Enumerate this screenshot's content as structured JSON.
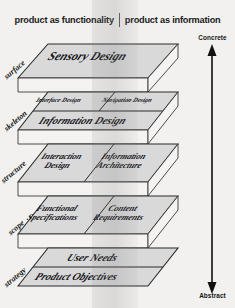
{
  "diagram": {
    "header": {
      "left_label": "product as functionality",
      "right_label": "product as information",
      "divider": "vertical-rule"
    },
    "axis": {
      "top_label": "Concrete",
      "bottom_label": "Abstract",
      "orientation": "vertical",
      "arrow": "double-headed"
    },
    "planes": [
      {
        "name": "surface",
        "cells": [
          {
            "text": "Sensory Design",
            "span": "full"
          }
        ]
      },
      {
        "name": "skeleton",
        "cells": [
          {
            "text": "Interface Design",
            "span": "left"
          },
          {
            "text": "Navigation Design",
            "span": "right"
          },
          {
            "text": "Information Design",
            "span": "full"
          }
        ]
      },
      {
        "name": "structure",
        "cells": [
          {
            "text": "Interaction Design",
            "span": "left"
          },
          {
            "text": "Information Architecture",
            "span": "right"
          }
        ]
      },
      {
        "name": "scope",
        "cells": [
          {
            "text": "Functional Specifications",
            "span": "left"
          },
          {
            "text": "Content Requirements",
            "span": "right"
          }
        ]
      },
      {
        "name": "strategy",
        "cells": [
          {
            "text": "User Needs",
            "span": "full"
          },
          {
            "text": "Product Objectives",
            "span": "full"
          }
        ]
      }
    ],
    "colors": {
      "slab_face": "#d9d9d9",
      "slab_face_light": "#e8e8e6",
      "outline": "#2a2a2a",
      "background": "#f2f1ef",
      "band": "#7a7a7a"
    }
  }
}
